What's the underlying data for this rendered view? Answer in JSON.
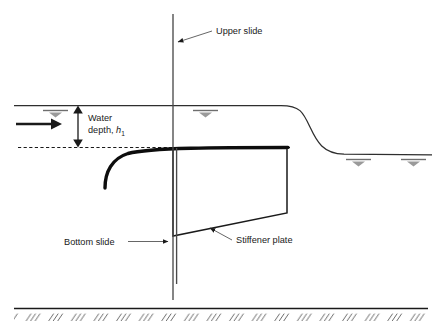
{
  "figure": {
    "type": "engineering-cross-section-diagram",
    "background_color": "#ffffff",
    "line_color": "#1a1a1a",
    "water_line_color": "#333333",
    "hatch_color": "#555555"
  },
  "labels": {
    "upper_slide": "Upper slide",
    "bottom_slide": "Bottom slide",
    "stiffener_plate": "Stiffener plate",
    "water_line1": "Water",
    "water_line2_prefix": "depth, ",
    "water_symbol_italic": "h",
    "water_symbol_subscript": "1"
  },
  "icons": {
    "water_table_symbol": "water-table-symbol",
    "flow_arrow": "flow-direction-arrow",
    "ground_hatch": "ground-hatch-pattern",
    "dimension_arrow": "dimension-double-arrow"
  },
  "geometry": {
    "upstream_water_surface_y": 105,
    "downstream_water_surface_y": 154,
    "gate_lip_y": 148,
    "ground_line_y": 308,
    "post_x": 173,
    "gate_right_x": 287,
    "stiffener_bottom_left_y": 236,
    "stiffener_bottom_right_y": 213,
    "post_top_y": 14,
    "post_bottom_y": 300
  },
  "water_symbols": [
    {
      "x": 55,
      "y": 111
    },
    {
      "x": 205,
      "y": 111
    },
    {
      "x": 358,
      "y": 156
    },
    {
      "x": 413,
      "y": 156
    }
  ],
  "flow_arrow": {
    "x_start": 16,
    "x_end": 60,
    "y": 124
  },
  "dimension": {
    "x": 78,
    "y_top": 107,
    "y_bottom": 145
  }
}
